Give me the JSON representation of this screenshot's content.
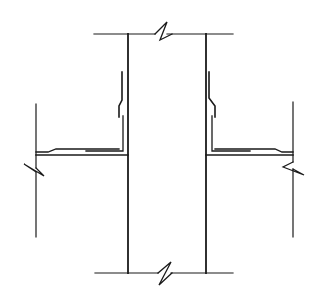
{
  "diagram": {
    "type": "architectural-section-detail",
    "colors": {
      "line": "#1a1a1a",
      "background": "#ffffff"
    },
    "elements": {
      "top_line": {
        "x1": 94,
        "x2": 233,
        "y": 34,
        "break_x": 163
      },
      "bottom_line": {
        "x1": 95,
        "x2": 233,
        "y": 273,
        "break_x": 166
      },
      "left_wall": {
        "x": 128,
        "y1": 34,
        "y2": 273
      },
      "right_wall": {
        "x": 206,
        "y1": 34,
        "y2": 273
      },
      "left_edge_line": {
        "x": 36,
        "y1": 104,
        "y2": 237,
        "break_y": 164
      },
      "right_edge_line": {
        "x": 293,
        "y1": 102,
        "y2": 237,
        "break_y": 166
      }
    },
    "labels": []
  }
}
